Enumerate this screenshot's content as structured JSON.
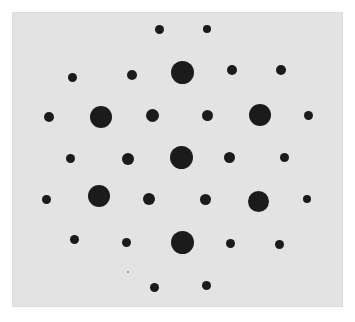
{
  "figure": {
    "background_color": "#ffffff",
    "panel_color": "#e3e3e3",
    "spot_color": "#1b1b1b",
    "panel": {
      "x": 12,
      "y": 12,
      "width": 331,
      "height": 295
    },
    "spots": [
      {
        "x": 159,
        "y": 29,
        "r": 4.5
      },
      {
        "x": 207,
        "y": 29,
        "r": 4
      },
      {
        "x": 72,
        "y": 77,
        "r": 4.5
      },
      {
        "x": 132,
        "y": 75,
        "r": 5
      },
      {
        "x": 182,
        "y": 72,
        "r": 11.5
      },
      {
        "x": 232,
        "y": 70,
        "r": 5
      },
      {
        "x": 281,
        "y": 70,
        "r": 5
      },
      {
        "x": 49,
        "y": 117,
        "r": 5
      },
      {
        "x": 101,
        "y": 117,
        "r": 11
      },
      {
        "x": 152,
        "y": 115,
        "r": 6.5
      },
      {
        "x": 207,
        "y": 115,
        "r": 5.5
      },
      {
        "x": 260,
        "y": 115,
        "r": 11
      },
      {
        "x": 308,
        "y": 115,
        "r": 4.5
      },
      {
        "x": 70,
        "y": 158,
        "r": 4.5
      },
      {
        "x": 128,
        "y": 159,
        "r": 6
      },
      {
        "x": 181,
        "y": 157,
        "r": 11.5
      },
      {
        "x": 229,
        "y": 157,
        "r": 5.5
      },
      {
        "x": 284,
        "y": 157,
        "r": 4.5
      },
      {
        "x": 46,
        "y": 199,
        "r": 4.5
      },
      {
        "x": 99,
        "y": 196,
        "r": 11
      },
      {
        "x": 149,
        "y": 199,
        "r": 6
      },
      {
        "x": 205,
        "y": 199,
        "r": 5.5
      },
      {
        "x": 258,
        "y": 201,
        "r": 10.5
      },
      {
        "x": 307,
        "y": 199,
        "r": 4
      },
      {
        "x": 74,
        "y": 239,
        "r": 4.5
      },
      {
        "x": 126,
        "y": 242,
        "r": 4.5
      },
      {
        "x": 182,
        "y": 242,
        "r": 11.5
      },
      {
        "x": 230,
        "y": 243,
        "r": 4.5
      },
      {
        "x": 279,
        "y": 244,
        "r": 4.5
      },
      {
        "x": 154,
        "y": 287,
        "r": 4.5
      },
      {
        "x": 206,
        "y": 285,
        "r": 4.5
      }
    ]
  }
}
